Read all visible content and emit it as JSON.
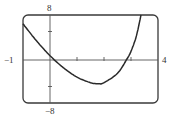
{
  "chart_data": {
    "type": "line",
    "title": "",
    "xlabel": "",
    "ylabel": "",
    "xlim": [
      -1,
      4
    ],
    "ylim": [
      -8,
      8
    ],
    "grid": false,
    "legend": null,
    "tick_labels": {
      "xmin": "−1",
      "xmax": "4",
      "ymax": "8",
      "ymin": "−8"
    },
    "x_ticks": [
      1,
      2,
      3
    ],
    "y_ticks": [
      -5,
      5
    ],
    "series": [
      {
        "name": "curve",
        "x": [
          -1,
          -0.5,
          0,
          0.5,
          1,
          1.5,
          1.8,
          2,
          2.5,
          2.85,
          3,
          3.2,
          3.37
        ],
        "y": [
          6.4,
          3.3,
          0.6,
          -1.6,
          -3.3,
          -4.3,
          -4.5,
          -4.3,
          -2.6,
          0,
          1.4,
          4.2,
          8
        ]
      }
    ]
  },
  "colors": {
    "curve": "#2a2a2a",
    "frame": "#3a3a3a",
    "axis": "#555555"
  }
}
